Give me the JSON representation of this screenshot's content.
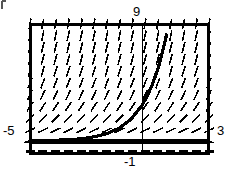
{
  "figure": {
    "kind": "slope-field-with-solution-curve",
    "background_color": "#ffffff",
    "ink_color": "#000000",
    "frame": {
      "x": 29,
      "y": 23,
      "width": 181,
      "height": 132,
      "border_px": 3
    }
  },
  "labels": {
    "top": "9",
    "left": "-5",
    "right": "3",
    "bottom": "-1"
  },
  "chart_data": {
    "type": "line",
    "title": "",
    "xlabel": "",
    "ylabel": "",
    "xlim": [
      -5,
      3
    ],
    "ylim": [
      -1,
      9
    ],
    "grid": false,
    "legend": "none",
    "axis_tick_labels": {
      "x_left": -5,
      "x_right": 3,
      "x_center_bottom": -1,
      "y_top": 9
    },
    "annotations": [
      {
        "name": "x-axis-vertical-line",
        "type": "vline",
        "x": 0,
        "style": "thin-solid"
      },
      {
        "name": "equilibrium-asymptote",
        "type": "hline",
        "y": 0,
        "style": "thick-solid"
      },
      {
        "name": "dashed-row-below-axis",
        "type": "hline",
        "y": -0.75,
        "style": "dashed"
      }
    ],
    "slope_field": {
      "description": "direction field of dy/dx proportional to y, segments steepen with increasing y",
      "x_samples": [
        -5,
        -4.43,
        -3.86,
        -3.29,
        -2.71,
        -2.14,
        -1.57,
        -1,
        -0.43,
        0.14,
        0.71,
        1.29,
        1.86,
        2.43,
        3
      ],
      "y_samples": [
        9,
        8.09,
        7.18,
        6.27,
        5.36,
        4.45,
        3.55,
        2.64,
        1.73,
        0.82,
        -0.09,
        -1
      ],
      "columns": 15,
      "rows": 12,
      "segment_length_px": 11
    },
    "series": [
      {
        "name": "solution-curve",
        "kind": "exponential",
        "style": "thick-solid",
        "x": [
          -5.0,
          -4.5,
          -4.0,
          -3.5,
          -3.0,
          -2.5,
          -2.0,
          -1.5,
          -1.0,
          -0.5,
          0.0,
          0.25,
          0.5,
          0.75,
          1.0,
          1.1
        ],
        "y": [
          0.02,
          0.03,
          0.05,
          0.08,
          0.13,
          0.22,
          0.37,
          0.61,
          1.0,
          1.65,
          2.72,
          3.49,
          4.48,
          5.75,
          7.39,
          8.17
        ]
      }
    ]
  }
}
